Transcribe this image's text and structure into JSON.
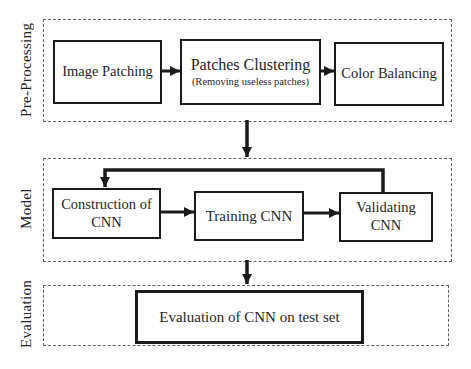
{
  "figure": {
    "type": "flowchart",
    "background": "#ffffff",
    "ink_color": "#1b1b1b",
    "dash_border_color": "#5e5e5e"
  },
  "sections": {
    "preprocessing": {
      "label": "Pre-Processing"
    },
    "model": {
      "label": "Model"
    },
    "evaluation": {
      "label": "Evaluation"
    }
  },
  "nodes": {
    "image_patching": {
      "label": "Image Patching"
    },
    "patches_clustering": {
      "label": "Patches Clustering",
      "sublabel": "(Removing useless patches)"
    },
    "color_balancing": {
      "label": "Color Balancing"
    },
    "construction_cnn": {
      "label": "Construction of CNN"
    },
    "training_cnn": {
      "label": "Training CNN"
    },
    "validating_cnn": {
      "label": "Validating CNN"
    },
    "evaluation_cnn": {
      "label": "Evaluation of CNN on test set"
    }
  },
  "edges": [
    {
      "from": "image_patching",
      "to": "patches_clustering",
      "style": "arrow"
    },
    {
      "from": "patches_clustering",
      "to": "color_balancing",
      "style": "arrow"
    },
    {
      "from": "preprocessing_section",
      "to": "model_section",
      "style": "arrow"
    },
    {
      "from": "construction_cnn",
      "to": "training_cnn",
      "style": "arrow"
    },
    {
      "from": "training_cnn",
      "to": "validating_cnn",
      "style": "arrow"
    },
    {
      "from": "validating_cnn",
      "to": "construction_cnn",
      "style": "feedback-arrow"
    },
    {
      "from": "model_section",
      "to": "evaluation_section",
      "style": "arrow"
    }
  ]
}
